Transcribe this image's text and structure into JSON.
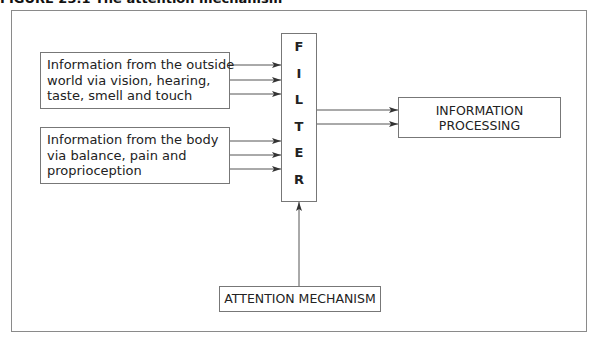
{
  "figure": {
    "title": "FIGURE 23.1 The attention mechanism"
  },
  "nodes": {
    "outside_world": {
      "lines": [
        "Information from the outside",
        "world via vision, hearing,",
        "taste, smell and touch"
      ]
    },
    "body": {
      "lines": [
        "Information from the body",
        "via balance, pain and",
        "proprioception"
      ]
    },
    "filter": {
      "letters": [
        "F",
        "I",
        "L",
        "T",
        "E",
        "R"
      ]
    },
    "information_processing": {
      "lines": [
        "INFORMATION",
        "PROCESSING"
      ]
    },
    "attention_mechanism": {
      "label": "ATTENTION MECHANISM"
    }
  },
  "edges": [
    {
      "from": "outside_world",
      "to": "filter",
      "count": 3
    },
    {
      "from": "body",
      "to": "filter",
      "count": 3
    },
    {
      "from": "filter",
      "to": "information_processing",
      "count": 2
    },
    {
      "from": "attention_mechanism",
      "to": "filter",
      "count": 1
    }
  ],
  "colors": {
    "line": "#555555",
    "border": "#777777",
    "frame": "#8a8a8a"
  }
}
